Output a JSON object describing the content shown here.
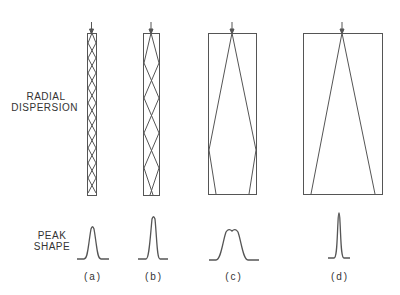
{
  "labels": {
    "radial_line1": "RADIAL",
    "radial_line2": "DISPERSION",
    "peak_line1": "PEAK",
    "peak_line2": "SHAPE"
  },
  "columns": [
    {
      "caption": "(a)",
      "description": "narrow column, many crossings"
    },
    {
      "caption": "(b)",
      "description": "wider column, fewer crossings"
    },
    {
      "caption": "(c)",
      "description": "wide column, rays reach walls near bottom"
    },
    {
      "caption": "(d)",
      "description": "widest column, rays do not reach walls"
    }
  ],
  "colors": {
    "line": "#555555",
    "text": "#333333",
    "background": "#ffffff"
  }
}
